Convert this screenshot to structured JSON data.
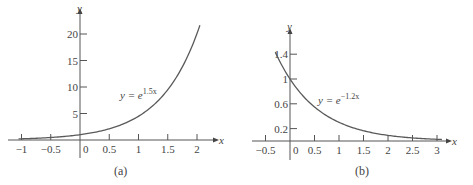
{
  "chart_data": [
    {
      "id": "a",
      "type": "line",
      "caption": "(a)",
      "title": "",
      "xlabel": "x",
      "ylabel": "y",
      "equation": {
        "lhs": "y = e",
        "exponent": "1.5x"
      },
      "function": "exp(1.5*x)",
      "coef": 1.5,
      "x_range": [
        -1.05,
        2.05
      ],
      "xlim": [
        -1.1,
        2.3
      ],
      "ylim": [
        0,
        22
      ],
      "x_ticks": [
        -1,
        -0.5,
        0,
        0.5,
        1,
        1.5,
        2
      ],
      "x_tick_labels": [
        "−1",
        "−0.5",
        "0",
        "0.5",
        "1",
        "1.5",
        "2"
      ],
      "y_ticks": [
        5,
        10,
        15,
        20
      ],
      "y_tick_labels": [
        "5",
        "10",
        "15",
        "20"
      ],
      "grid": false,
      "legend": null,
      "series": [
        {
          "name": "y = e^{1.5x}",
          "x": [
            -1,
            -0.5,
            0,
            0.5,
            1,
            1.5,
            2
          ],
          "values": [
            0.22,
            0.47,
            1.0,
            2.12,
            4.48,
            9.49,
            20.09
          ]
        }
      ]
    },
    {
      "id": "b",
      "type": "line",
      "caption": "(b)",
      "title": "",
      "xlabel": "x",
      "ylabel": "y",
      "equation": {
        "lhs": "y = e",
        "exponent": "−1.2x"
      },
      "function": "exp(-1.2*x)",
      "coef": -1.2,
      "x_range": [
        -0.3,
        3.1
      ],
      "xlim": [
        -0.6,
        3.3
      ],
      "ylim": [
        0,
        1.6
      ],
      "x_ticks": [
        -0.5,
        0,
        0.5,
        1,
        1.5,
        2,
        2.5,
        3
      ],
      "x_tick_labels": [
        "−0.5",
        "0",
        "0.5",
        "1",
        "1.5",
        "2",
        "2.5",
        "3"
      ],
      "y_ticks": [
        0.2,
        0.6,
        1,
        1.4
      ],
      "y_tick_labels": [
        "0.2",
        "0.6",
        "1",
        "1.4"
      ],
      "grid": false,
      "legend": null,
      "series": [
        {
          "name": "y = e^{-1.2x}",
          "x": [
            -0.3,
            0,
            0.5,
            1,
            1.5,
            2,
            2.5,
            3
          ],
          "values": [
            1.43,
            1.0,
            0.55,
            0.3,
            0.17,
            0.09,
            0.05,
            0.03
          ]
        }
      ]
    }
  ]
}
